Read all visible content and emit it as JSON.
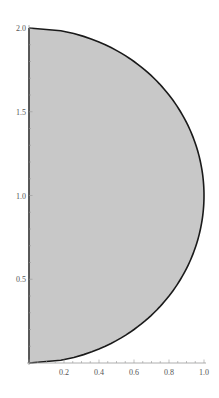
{
  "chart_data": {
    "type": "area",
    "title": "",
    "xlabel": "",
    "ylabel": "",
    "curve": {
      "equation": "x = sqrt(1 - (y - 1)^2)",
      "center": [
        0,
        1
      ],
      "radius": 1,
      "points": [
        {
          "y": 0.0,
          "x": 0.0
        },
        {
          "y": 0.25,
          "x": 0.661
        },
        {
          "y": 0.5,
          "x": 0.866
        },
        {
          "y": 0.75,
          "x": 0.968
        },
        {
          "y": 1.0,
          "x": 1.0
        },
        {
          "y": 1.25,
          "x": 0.968
        },
        {
          "y": 1.5,
          "x": 0.866
        },
        {
          "y": 1.75,
          "x": 0.661
        },
        {
          "y": 2.0,
          "x": 0.0
        }
      ]
    },
    "fill_color": "#c8c8c8",
    "stroke_color": "#1a1a1a",
    "xlim": [
      0,
      1.0
    ],
    "ylim": [
      0,
      2.0
    ],
    "x_ticks": [
      "0.2",
      "0.4",
      "0.6",
      "0.8",
      "1.0"
    ],
    "x_tick_values": [
      0.2,
      0.4,
      0.6,
      0.8,
      1.0
    ],
    "y_ticks": [
      "0.5",
      "1.0",
      "1.5",
      "2.0"
    ],
    "y_tick_values": [
      0.5,
      1.0,
      1.5,
      2.0
    ],
    "grid": false,
    "legend": null
  }
}
